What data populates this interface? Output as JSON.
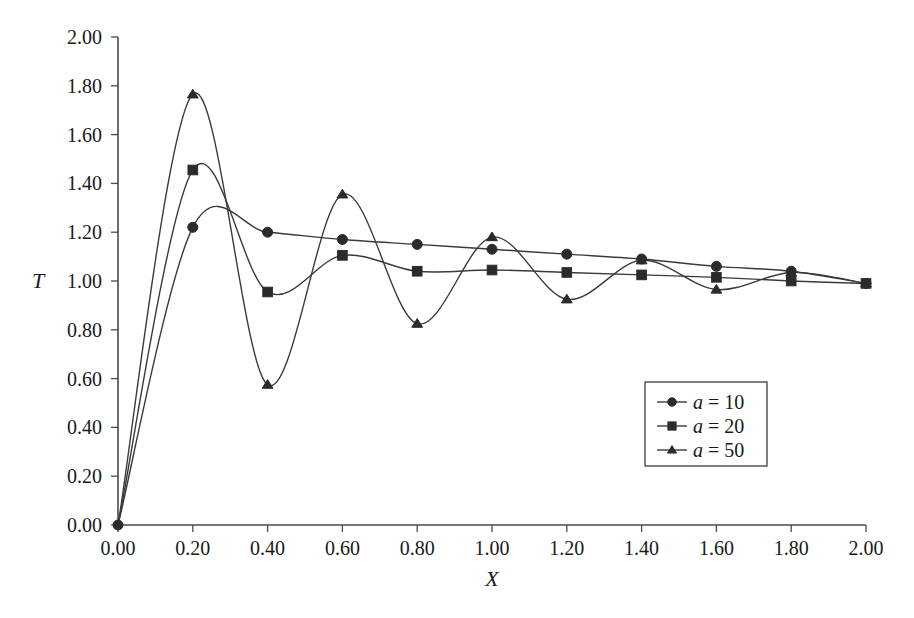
{
  "chart_data": {
    "type": "line",
    "title": "",
    "xlabel": "X",
    "ylabel": "T",
    "xlim": [
      0.0,
      2.0
    ],
    "ylim": [
      0.0,
      2.0
    ],
    "grid": false,
    "legend_position": "center-right",
    "x_ticks": [
      "0.00",
      "0.20",
      "0.40",
      "0.60",
      "0.80",
      "1.00",
      "1.20",
      "1.40",
      "1.60",
      "1.80",
      "2.00"
    ],
    "y_ticks": [
      "0.00",
      "0.20",
      "0.40",
      "0.60",
      "0.80",
      "1.00",
      "1.20",
      "1.40",
      "1.60",
      "1.80",
      "2.00"
    ],
    "x": [
      0.0,
      0.2,
      0.4,
      0.6,
      0.8,
      1.0,
      1.2,
      1.4,
      1.6,
      1.8,
      2.0
    ],
    "series": [
      {
        "name": "a = 10",
        "marker": "circle",
        "values": [
          0.0,
          1.22,
          1.2,
          1.17,
          1.15,
          1.13,
          1.11,
          1.09,
          1.06,
          1.04,
          0.99
        ]
      },
      {
        "name": "a = 20",
        "marker": "square",
        "values": [
          0.0,
          1.455,
          0.955,
          1.105,
          1.04,
          1.045,
          1.035,
          1.025,
          1.015,
          1.0,
          0.99
        ]
      },
      {
        "name": "a = 50",
        "marker": "triangle",
        "values": [
          0.0,
          1.765,
          0.575,
          1.355,
          0.825,
          1.18,
          0.925,
          1.085,
          0.965,
          1.035,
          0.99
        ]
      }
    ]
  },
  "legend": {
    "items": [
      {
        "label_prefix": "a",
        "label_rest": " = 10",
        "marker": "circle"
      },
      {
        "label_prefix": "a",
        "label_rest": " = 20",
        "marker": "square"
      },
      {
        "label_prefix": "a",
        "label_rest": " = 50",
        "marker": "triangle"
      }
    ]
  },
  "axis_titles": {
    "y": "T",
    "x": "X"
  }
}
